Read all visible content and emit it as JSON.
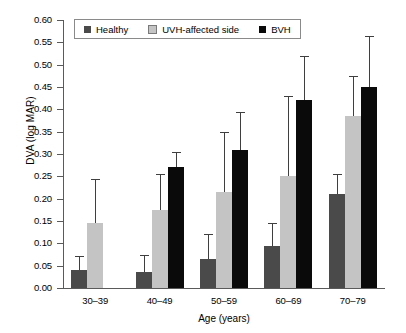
{
  "chart_data": {
    "type": "bar",
    "title": "",
    "xlabel": "Age (years)",
    "ylabel": "DVA (log MAR)",
    "categories": [
      "30–39",
      "40–49",
      "50–59",
      "60–69",
      "70–79"
    ],
    "ylim": [
      0.0,
      0.6
    ],
    "ytick_labels": [
      "0.00",
      "0.05",
      "0.10",
      "0.15",
      "0.20",
      "0.25",
      "0.30",
      "0.35",
      "0.40",
      "0.45",
      "0.50",
      "0.55",
      "0.60"
    ],
    "ytick_values": [
      0.0,
      0.05,
      0.1,
      0.15,
      0.2,
      0.25,
      0.3,
      0.35,
      0.4,
      0.45,
      0.5,
      0.55,
      0.6
    ],
    "grid": false,
    "legend_position": "top-left",
    "error_bars": "upper-only",
    "series": [
      {
        "name": "Healthy",
        "color": "#4a4a4a",
        "values": [
          0.04,
          0.035,
          0.065,
          0.093,
          0.21
        ],
        "err_upper": [
          0.072,
          0.075,
          0.12,
          0.145,
          0.255
        ]
      },
      {
        "name": "UVH-affected side",
        "color": "#c4c4c4",
        "values": [
          0.145,
          0.175,
          0.215,
          0.25,
          0.385
        ],
        "err_upper": [
          0.245,
          0.255,
          0.35,
          0.43,
          0.475
        ]
      },
      {
        "name": "BVH",
        "color": "#0a0a0a",
        "values": [
          null,
          0.27,
          0.31,
          0.42,
          0.45
        ],
        "err_upper": [
          null,
          0.305,
          0.395,
          0.52,
          0.565
        ]
      }
    ]
  }
}
